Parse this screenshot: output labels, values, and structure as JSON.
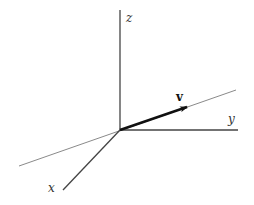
{
  "diagram": {
    "type": "3d-coordinate-axes-with-vector",
    "origin": [
      120,
      130
    ],
    "axes": {
      "z": {
        "label": "z",
        "end": [
          120,
          10
        ],
        "label_pos": [
          126,
          22
        ]
      },
      "y": {
        "label": "y",
        "end": [
          238,
          130
        ],
        "label_pos": [
          228,
          123
        ]
      },
      "x": {
        "label": "x",
        "end": [
          63,
          190
        ],
        "label_pos": [
          48,
          192
        ]
      }
    },
    "line_through_origin": {
      "start": [
        19,
        166
      ],
      "end": [
        236,
        90
      ],
      "color": "#8a8a8a"
    },
    "vector": {
      "label": "v",
      "tip": [
        187,
        107
      ],
      "label_pos": [
        176,
        101
      ],
      "color": "#111111"
    },
    "colors": {
      "axis": "#444444",
      "line": "#8a8a8a",
      "vector": "#111111",
      "label": "#333333"
    }
  }
}
